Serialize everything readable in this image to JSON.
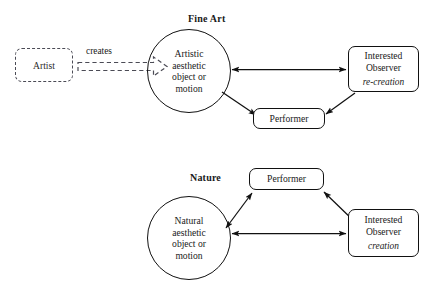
{
  "figure": {
    "type": "diagram",
    "background": "#ffffff",
    "line_color": "#111111",
    "dashed_color": "#4b4b55"
  },
  "panels": [
    {
      "id": "fine-art",
      "title": "Fine Art",
      "source": {
        "label": "Artist",
        "style": "dashed-rounded-rect"
      },
      "source_edge": {
        "label": "creates",
        "style": "dashed-hollow-block-arrow",
        "direction": "source-to-circle"
      },
      "circle": {
        "lines": [
          "Artistic",
          "aesthetic",
          "object or",
          "motion"
        ]
      },
      "performer": {
        "label": "Performer"
      },
      "observer": {
        "label_line_1": "Interested",
        "label_line_2": "Observer",
        "emphasis": "re-creation"
      },
      "edges": [
        {
          "from": "circle",
          "to": "observer",
          "direction": "both"
        },
        {
          "from": "circle",
          "to": "performer",
          "direction": "to-performer"
        },
        {
          "from": "observer",
          "to": "performer",
          "direction": "to-performer"
        }
      ]
    },
    {
      "id": "nature",
      "title": "Nature",
      "circle": {
        "lines": [
          "Natural",
          "aesthetic",
          "object or",
          "motion"
        ]
      },
      "performer": {
        "label": "Performer"
      },
      "observer": {
        "label_line_1": "Interested",
        "label_line_2": "Observer",
        "emphasis": "creation"
      },
      "edges": [
        {
          "from": "circle",
          "to": "observer",
          "direction": "both"
        },
        {
          "from": "circle",
          "to": "performer",
          "direction": "both"
        },
        {
          "from": "observer",
          "to": "performer",
          "direction": "both"
        }
      ]
    }
  ]
}
